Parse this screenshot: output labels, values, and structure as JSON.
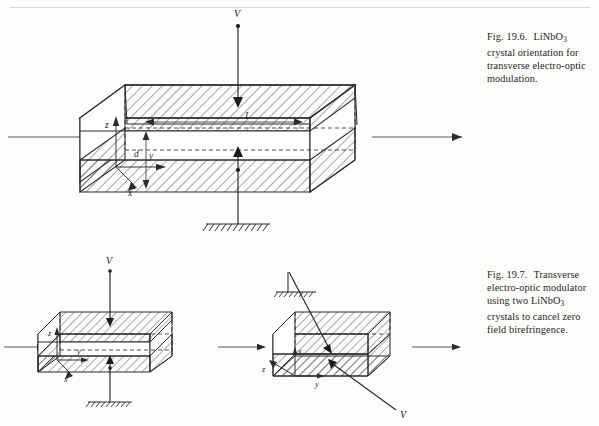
{
  "page": {
    "background": "#fdfdfc",
    "ink": "#2b2b2b"
  },
  "figures": [
    {
      "id": "fig-19-6",
      "number": "Fig. 19.6.",
      "caption_lines": [
        "LiNbO3 crystal",
        "orientation for transverse",
        "electro-optic modulation."
      ],
      "caption_text": "Fig. 19.6.  LiNbO3 crystal orientation for transverse electro-optic modulation.",
      "labels": {
        "voltage": "V",
        "length": "L",
        "thickness": "d",
        "axis_z": "z",
        "axis_y": "y",
        "axis_x": "x"
      },
      "elements": {
        "beam_in": "input-beam-arrow",
        "beam_out": "output-beam-arrow",
        "ground": "ground-symbol",
        "electrode_top": "top-electrode",
        "electrode_bottom": "bottom-electrode"
      }
    },
    {
      "id": "fig-19-7",
      "number": "Fig. 19.7.",
      "caption_lines": [
        "Transverse",
        "electro-optic modulator",
        "using two LiNbO3 crystals",
        "to cancel zero field",
        "birefringence."
      ],
      "caption_text": "Fig. 19.7.  Transverse electro-optic modulator using two LiNbO3 crystals to cancel zero field birefringence.",
      "left_panel": {
        "labels": {
          "voltage": "V",
          "axis_z": "z",
          "axis_y": "y",
          "axis_x": "x"
        }
      },
      "right_panel": {
        "labels": {
          "voltage": "V",
          "axis_z": "z",
          "axis_y": "y",
          "axis_x": "x"
        }
      }
    }
  ],
  "caption_parts": {
    "linbo3_prefix": "LiNbO",
    "linbo3_sub": "3"
  }
}
